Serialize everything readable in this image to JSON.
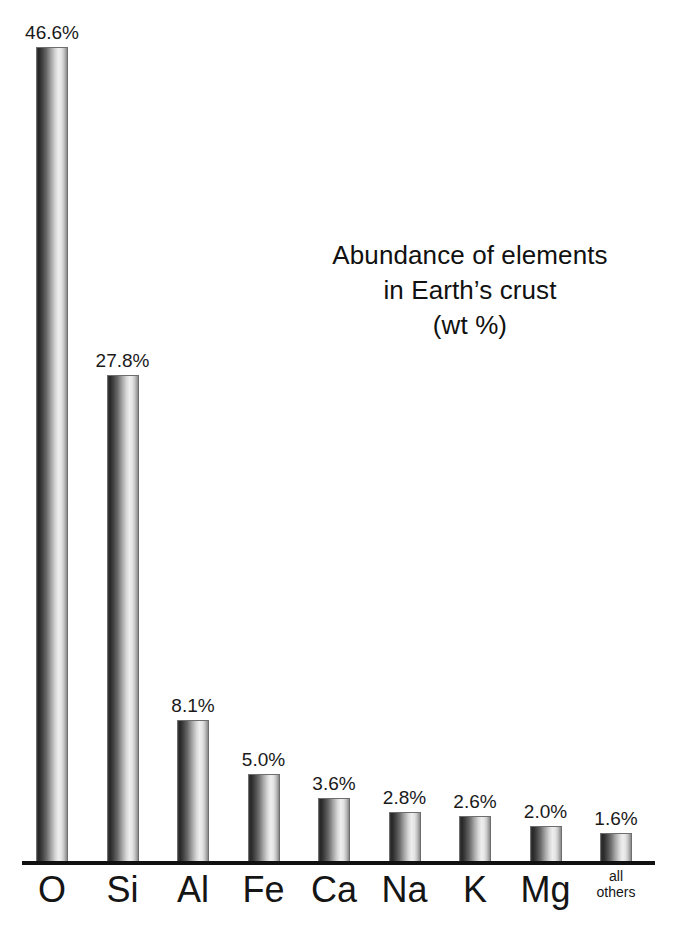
{
  "title": {
    "line1": "Abundance of elements",
    "line2": "in Earth’s crust",
    "line3": "(wt %)"
  },
  "chart_data": {
    "type": "bar",
    "xlabel": "",
    "ylabel": "",
    "ylim": [
      0,
      46.6
    ],
    "grid": false,
    "legend": "none",
    "units": "wt %",
    "categories": [
      "O",
      "Si",
      "Al",
      "Fe",
      "Ca",
      "Na",
      "K",
      "Mg",
      "all others"
    ],
    "values": [
      46.6,
      27.8,
      8.1,
      5.0,
      3.6,
      2.8,
      2.6,
      2.0,
      1.6
    ],
    "data_labels": [
      "46.6%",
      "27.8%",
      "8.1%",
      "5.0%",
      "3.6%",
      "2.8%",
      "2.6%",
      "2.0%",
      "1.6%"
    ],
    "bars": [
      {
        "category": "O",
        "label": "O",
        "value": 46.6,
        "data_label": "46.6%",
        "multiline": false
      },
      {
        "category": "Si",
        "label": "Si",
        "value": 27.8,
        "data_label": "27.8%",
        "multiline": false
      },
      {
        "category": "Al",
        "label": "Al",
        "value": 8.1,
        "data_label": "8.1%",
        "multiline": false
      },
      {
        "category": "Fe",
        "label": "Fe",
        "value": 5.0,
        "data_label": "5.0%",
        "multiline": false
      },
      {
        "category": "Ca",
        "label": "Ca",
        "value": 3.6,
        "data_label": "3.6%",
        "multiline": false
      },
      {
        "category": "Na",
        "label": "Na",
        "value": 2.8,
        "data_label": "2.8%",
        "multiline": false
      },
      {
        "category": "K",
        "label": "K",
        "value": 2.6,
        "data_label": "2.6%",
        "multiline": false
      },
      {
        "category": "Mg",
        "label": "Mg",
        "value": 2.0,
        "data_label": "2.0%",
        "multiline": false
      },
      {
        "category": "all others",
        "label": "all\nothers",
        "value": 1.6,
        "data_label": "1.6%",
        "multiline": true
      }
    ],
    "colors": {
      "bar_dark": "#262626",
      "bar_light": "#eeeeee",
      "bar_edge": "#6e6e6e",
      "axis": "#111111",
      "text": "#151515",
      "background": "#ffffff"
    }
  },
  "layout": {
    "baseline_y": 861,
    "first_bar_left": 36,
    "bar_width": 32,
    "bar_pitch": 70.5,
    "px_per_percent": 17.47,
    "value_label_gap": 5
  }
}
